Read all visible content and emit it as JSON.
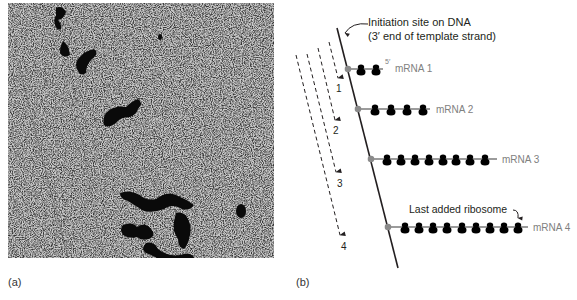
{
  "panels": {
    "a": {
      "label": "(a)",
      "content": "electron-micrograph-polyribosomes"
    },
    "b": {
      "label": "(b)"
    }
  },
  "diagram": {
    "initiation_label_line1": "Initiation site on DNA",
    "initiation_label_line2": "(3′ end of template strand)",
    "five_prime": "5′",
    "last_added_label": "Last added ribosome",
    "mrnas": [
      {
        "label": "mRNA 1",
        "ribosomes": 2
      },
      {
        "label": "mRNA 2",
        "ribosomes": 4
      },
      {
        "label": "mRNA 3",
        "ribosomes": 8
      },
      {
        "label": "mRNA 4",
        "ribosomes": 9
      }
    ],
    "time_arrows": [
      "1",
      "2",
      "3",
      "4"
    ],
    "colors": {
      "dna": "#231f20",
      "mrna": "#7a7a7a",
      "ribosome": "#000000",
      "site": "#8a8a8a",
      "label_gray": "#808080"
    }
  }
}
